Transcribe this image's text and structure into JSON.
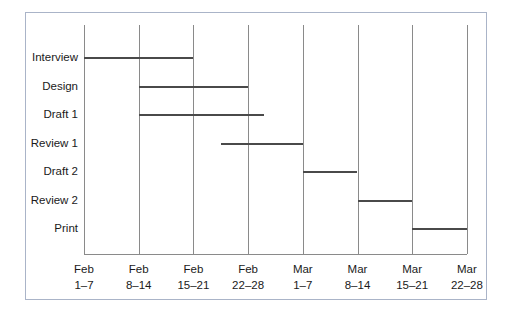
{
  "chart_data": {
    "type": "bar",
    "subtype": "gantt",
    "title": "",
    "xlabel": "",
    "ylabel": "",
    "grid": true,
    "legend": null,
    "orientation": "horizontal",
    "x_axis": {
      "tick_labels": [
        {
          "month": "Feb",
          "days": "1–7"
        },
        {
          "month": "Feb",
          "days": "8–14"
        },
        {
          "month": "Feb",
          "days": "15–21"
        },
        {
          "month": "Feb",
          "days": "22–28"
        },
        {
          "month": "Mar",
          "days": "1–7"
        },
        {
          "month": "Mar",
          "days": "8–14"
        },
        {
          "month": "Mar",
          "days": "15–21"
        },
        {
          "month": "Mar",
          "days": "22–28"
        }
      ],
      "unit": "week",
      "range_start": 0,
      "range_end": 8
    },
    "categories": [
      "Interview",
      "Design",
      "Draft 1",
      "Review 1",
      "Draft 2",
      "Review 2",
      "Print"
    ],
    "tasks": [
      {
        "name": "Interview",
        "start": 0.0,
        "end": 2.0,
        "start_label": "Feb 1–7",
        "end_label": "Feb 15–21"
      },
      {
        "name": "Design",
        "start": 1.0,
        "end": 3.0,
        "start_label": "Feb 8–14",
        "end_label": "Feb 22–28"
      },
      {
        "name": "Draft 1",
        "start": 1.0,
        "end": 3.3,
        "start_label": "Feb 8–14",
        "end_label": "Feb 22–28"
      },
      {
        "name": "Review 1",
        "start": 2.5,
        "end": 4.0,
        "start_label": "Feb 15–21",
        "end_label": "Mar 1–7"
      },
      {
        "name": "Draft 2",
        "start": 4.0,
        "end": 5.0,
        "start_label": "Mar 1–7",
        "end_label": "Mar 8–14"
      },
      {
        "name": "Review 2",
        "start": 5.0,
        "end": 6.0,
        "start_label": "Mar 8–14",
        "end_label": "Mar 15–21"
      },
      {
        "name": "Print",
        "start": 6.0,
        "end": 7.0,
        "start_label": "Mar 15–21",
        "end_label": "Mar 22–28"
      }
    ],
    "colors": {
      "bar": "#4a4a4a",
      "grid": "#8a8a8a",
      "frame": "#aab4c8",
      "text": "#1a1a1a",
      "background": "#ffffff"
    }
  },
  "labels": {
    "rows": [
      "Interview",
      "Design",
      "Draft 1",
      "Review 1",
      "Draft 2",
      "Review 2",
      "Print"
    ]
  }
}
